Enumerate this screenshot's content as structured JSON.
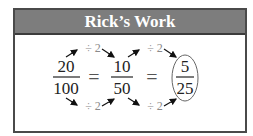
{
  "card": {
    "title": "Rick’s Work",
    "header_color": "#7d7d7d",
    "border_color": "#4a4a4a"
  },
  "fractions": [
    {
      "numerator": "20",
      "denominator": "100"
    },
    {
      "numerator": "10",
      "denominator": "50"
    },
    {
      "numerator": "5",
      "denominator": "25",
      "circled": true
    }
  ],
  "equals": [
    "=",
    "="
  ],
  "operations": {
    "top": [
      "÷ 2",
      "÷ 2"
    ],
    "bottom": [
      "÷ 2",
      "÷ 2"
    ]
  }
}
